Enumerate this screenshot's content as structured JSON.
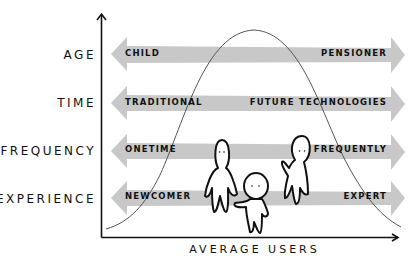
{
  "diagram": {
    "x_axis_label": "AVERAGE USERS",
    "rows": [
      {
        "label": "AGE",
        "left": "CHILD",
        "right": "PENSIONER"
      },
      {
        "label": "TIME",
        "left": "TRADITIONAL",
        "right": "FUTURE TECHNOLOGIES"
      },
      {
        "label": "FREQUENCY",
        "left": "ONETIME",
        "right": "FREQUENTLY"
      },
      {
        "label": "EXPERIENCE",
        "left": "NEWCOMER",
        "right": "EXPERT"
      }
    ],
    "curve": "bell-curve",
    "figures": [
      "person-figure-1",
      "person-figure-2",
      "person-figure-3"
    ],
    "colors": {
      "arrow": "#c8c8c8",
      "axis": "#111111",
      "curve": "#555555",
      "text": "#111111"
    }
  }
}
